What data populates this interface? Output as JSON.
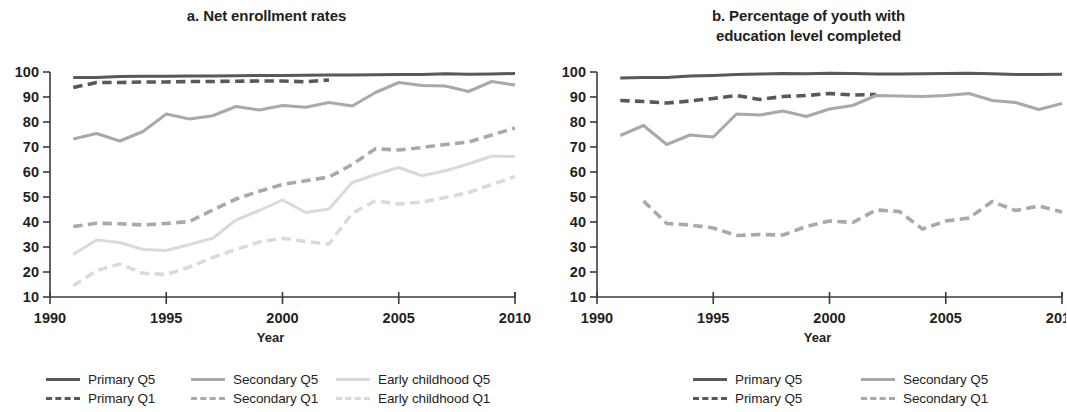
{
  "figure": {
    "x_axis_label": "Year"
  },
  "colors": {
    "primary": "#58595b",
    "secondary": "#a7a9ac",
    "early_childhood": "#d9dadb",
    "axis": "#3b3b3b",
    "text": "#231f20",
    "background": "#ffffff"
  },
  "panels": [
    {
      "id": "panel-a",
      "title": "a. Net enrollment rates",
      "x_axis_label": "Year",
      "legend_rows": [
        [
          {
            "label": "Primary Q5",
            "color_key": "primary",
            "style": "solid",
            "width": 3.4
          },
          {
            "label": "Secondary Q5",
            "color_key": "secondary",
            "style": "solid",
            "width": 3.4
          },
          {
            "label": "Early childhood Q5",
            "color_key": "early_childhood",
            "style": "solid",
            "width": 3.4
          }
        ],
        [
          {
            "label": "Primary Q1",
            "color_key": "primary",
            "style": "dashed",
            "width": 3.4
          },
          {
            "label": "Secondary Q1",
            "color_key": "secondary",
            "style": "dashed",
            "width": 3.4
          },
          {
            "label": "Early childhood Q1",
            "color_key": "early_childhood",
            "style": "dashed",
            "width": 3.4
          }
        ]
      ]
    },
    {
      "id": "panel-b",
      "title": "b. Percentage of youth with education level completed",
      "title_lines": [
        "b. Percentage of youth with",
        "education level completed"
      ],
      "x_axis_label": "Year",
      "legend_rows": [
        [
          {
            "label": "Primary Q5",
            "color_key": "primary",
            "style": "solid",
            "width": 3.4
          },
          {
            "label": "Secondary Q5",
            "color_key": "secondary",
            "style": "solid",
            "width": 3.4
          }
        ],
        [
          {
            "label": "Primary Q5",
            "color_key": "primary",
            "style": "dashed",
            "width": 3.4
          },
          {
            "label": "Secondary Q1",
            "color_key": "secondary",
            "style": "dashed",
            "width": 3.4
          }
        ]
      ]
    }
  ],
  "chart_data": [
    {
      "type": "line",
      "title": "a. Net enrollment rates",
      "xlabel": "Year",
      "ylabel": "",
      "xlim": [
        1990,
        2010
      ],
      "ylim": [
        10,
        100
      ],
      "xticks": [
        1990,
        1995,
        2000,
        2005,
        2010
      ],
      "yticks": [
        10,
        20,
        30,
        40,
        50,
        60,
        70,
        80,
        90,
        100
      ],
      "grid": false,
      "legend_position": "below",
      "x": [
        1991,
        1992,
        1993,
        1994,
        1995,
        1996,
        1997,
        1998,
        1999,
        2000,
        2001,
        2002,
        2003,
        2004,
        2005,
        2006,
        2007,
        2008,
        2009,
        2010
      ],
      "series": [
        {
          "name": "Primary Q5",
          "style": "solid",
          "color_key": "primary",
          "values": [
            97.8,
            97.8,
            98.2,
            98.3,
            98.3,
            98.4,
            98.4,
            98.5,
            98.6,
            98.6,
            98.7,
            98.8,
            98.8,
            98.9,
            99.0,
            99.0,
            99.3,
            99.1,
            99.2,
            99.4
          ]
        },
        {
          "name": "Primary Q1",
          "style": "dashed",
          "color_key": "primary",
          "values": [
            93.8,
            95.8,
            95.8,
            96.0,
            96.0,
            96.2,
            96.2,
            96.3,
            96.4,
            96.4,
            96.1,
            96.8,
            null,
            null,
            null,
            null,
            null,
            null,
            null,
            null
          ]
        },
        {
          "name": "Secondary Q5",
          "style": "solid",
          "color_key": "secondary",
          "values": [
            73.2,
            75.4,
            72.4,
            76.2,
            83.2,
            81.2,
            82.5,
            86.2,
            84.8,
            86.6,
            85.9,
            87.8,
            86.4,
            91.8,
            95.8,
            94.6,
            94.4,
            92.2,
            96.2,
            94.8
          ]
        },
        {
          "name": "Secondary Q1",
          "style": "dashed",
          "color_key": "secondary",
          "values": [
            38.2,
            39.5,
            39.3,
            38.8,
            39.4,
            40.2,
            44.8,
            49.2,
            52.3,
            55.0,
            56.5,
            58.0,
            63.0,
            69.3,
            68.8,
            69.8,
            71.0,
            72.0,
            74.8,
            77.6
          ]
        },
        {
          "name": "Early childhood Q5",
          "style": "solid",
          "color_key": "early_childhood",
          "values": [
            27.0,
            32.8,
            31.8,
            29.0,
            28.6,
            31.0,
            33.5,
            40.8,
            44.6,
            48.8,
            43.8,
            45.2,
            55.8,
            59.0,
            61.8,
            58.5,
            60.5,
            63.2,
            66.4,
            66.2
          ]
        },
        {
          "name": "Early childhood Q1",
          "style": "dashed",
          "color_key": "early_childhood",
          "values": [
            14.5,
            20.5,
            23.2,
            19.5,
            19.0,
            22.0,
            25.8,
            29.0,
            32.0,
            33.5,
            32.2,
            31.2,
            43.5,
            48.5,
            47.2,
            48.0,
            49.8,
            51.8,
            55.0,
            58.2
          ]
        }
      ]
    },
    {
      "type": "line",
      "title": "b. Percentage of youth with education level completed",
      "xlabel": "Year",
      "ylabel": "",
      "xlim": [
        1990,
        2010
      ],
      "ylim": [
        10,
        100
      ],
      "xticks": [
        1990,
        1995,
        2000,
        2005,
        2010
      ],
      "yticks": [
        10,
        20,
        30,
        40,
        50,
        60,
        70,
        80,
        90,
        100
      ],
      "grid": false,
      "legend_position": "below",
      "x": [
        1991,
        1992,
        1993,
        1994,
        1995,
        1996,
        1997,
        1998,
        1999,
        2000,
        2001,
        2002,
        2003,
        2004,
        2005,
        2006,
        2007,
        2008,
        2009,
        2010
      ],
      "series": [
        {
          "name": "Primary Q5",
          "style": "solid",
          "color_key": "primary",
          "values": [
            97.6,
            97.8,
            97.8,
            98.4,
            98.6,
            99.0,
            99.2,
            99.4,
            99.3,
            99.5,
            99.4,
            99.2,
            99.2,
            99.3,
            99.4,
            99.5,
            99.3,
            99.0,
            99.0,
            99.1
          ]
        },
        {
          "name": "Primary Q5 (Q1)",
          "style": "dashed",
          "color_key": "primary",
          "values": [
            88.6,
            88.2,
            87.6,
            88.4,
            89.4,
            90.6,
            89.0,
            90.2,
            90.6,
            91.4,
            90.8,
            91.0,
            null,
            null,
            null,
            null,
            null,
            null,
            null,
            null
          ]
        },
        {
          "name": "Secondary Q5",
          "style": "solid",
          "color_key": "secondary",
          "values": [
            74.6,
            78.6,
            71.0,
            74.8,
            74.0,
            83.2,
            82.8,
            84.4,
            82.2,
            85.2,
            86.6,
            90.6,
            90.4,
            90.2,
            90.6,
            91.4,
            88.6,
            87.8,
            85.0,
            87.4
          ]
        },
        {
          "name": "Secondary Q1",
          "style": "dashed",
          "color_key": "secondary",
          "values": [
            null,
            48.4,
            39.4,
            38.8,
            37.6,
            34.6,
            35.0,
            34.8,
            38.2,
            40.4,
            39.8,
            44.8,
            44.2,
            37.2,
            40.4,
            41.6,
            48.2,
            44.6,
            46.4,
            44.0
          ]
        }
      ]
    }
  ]
}
